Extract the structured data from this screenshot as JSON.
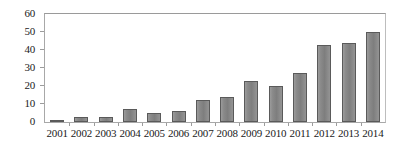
{
  "chart_data": {
    "type": "bar",
    "title": "",
    "subtitle": "",
    "xlabel": "",
    "ylabel": "",
    "categories": [
      "2001",
      "2002",
      "2003",
      "2004",
      "2005",
      "2006",
      "2007",
      "2008",
      "2009",
      "2010",
      "2011",
      "2012",
      "2013",
      "2014"
    ],
    "values": [
      1,
      3,
      3,
      7,
      5,
      6,
      12,
      14,
      23,
      20,
      27,
      43,
      44,
      50
    ],
    "series": [
      {
        "name": "",
        "values": [
          1,
          3,
          3,
          7,
          5,
          6,
          12,
          14,
          23,
          20,
          27,
          43,
          44,
          50
        ]
      }
    ],
    "ylim": [
      0,
      60
    ],
    "xlim_categories": 14,
    "y_ticks": [
      0,
      10,
      20,
      30,
      40,
      50,
      60
    ],
    "y_tick_labels": [
      "0",
      "10",
      "20",
      "30",
      "40",
      "50",
      "60"
    ],
    "x_tick_labels": [
      "2001",
      "2002",
      "2003",
      "2004",
      "2005",
      "2006",
      "2007",
      "2008",
      "2009",
      "2010",
      "2011",
      "2012",
      "2013",
      "2014"
    ],
    "grid": false,
    "legend": false,
    "legend_position": "none",
    "annotations": [],
    "colors": {
      "bar_fill": "#878787",
      "bar_border": "#5a5a5a",
      "axis_line": "#9c9c9c",
      "frame": "#a8a8a8",
      "text": "#1a1a1a",
      "background": "#ffffff"
    }
  }
}
